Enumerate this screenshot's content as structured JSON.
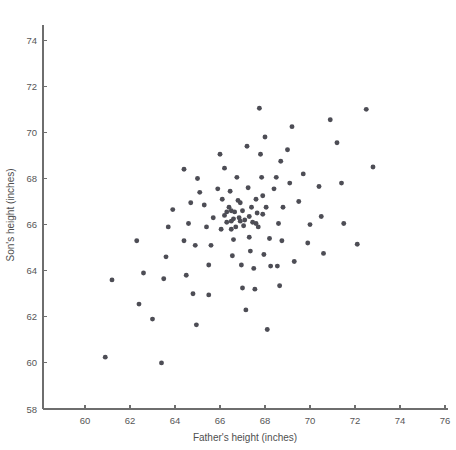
{
  "chart_data": {
    "type": "scatter",
    "title": "",
    "xlabel": "Father's height (inches)",
    "ylabel": "Son's height (inches)",
    "xlim": [
      58.8,
      76.5
    ],
    "ylim": [
      58,
      75.2
    ],
    "xticks": [
      60,
      62,
      64,
      66,
      68,
      70,
      72,
      74,
      76
    ],
    "yticks": [
      58,
      60,
      62,
      64,
      66,
      68,
      70,
      72,
      74
    ],
    "grid": false,
    "legend": null,
    "marker_color": "#4d4d55",
    "axis_color": "#6e6e6e",
    "background": "#ffffff",
    "n_points": 106,
    "points": [
      [
        60.9,
        60.25
      ],
      [
        61.2,
        63.6
      ],
      [
        62.4,
        62.55
      ],
      [
        62.3,
        65.3
      ],
      [
        62.6,
        63.9
      ],
      [
        63.0,
        61.9
      ],
      [
        63.4,
        60.0
      ],
      [
        63.5,
        63.65
      ],
      [
        63.6,
        64.6
      ],
      [
        63.7,
        65.9
      ],
      [
        63.9,
        66.65
      ],
      [
        64.4,
        68.4
      ],
      [
        64.4,
        65.3
      ],
      [
        64.5,
        63.8
      ],
      [
        64.6,
        66.05
      ],
      [
        64.7,
        66.95
      ],
      [
        64.8,
        63.0
      ],
      [
        64.9,
        65.1
      ],
      [
        64.95,
        61.65
      ],
      [
        65.0,
        68.0
      ],
      [
        65.1,
        67.4
      ],
      [
        65.3,
        66.85
      ],
      [
        65.4,
        65.9
      ],
      [
        65.5,
        62.95
      ],
      [
        65.5,
        64.25
      ],
      [
        65.6,
        65.1
      ],
      [
        65.7,
        66.3
      ],
      [
        65.9,
        67.55
      ],
      [
        66.0,
        69.05
      ],
      [
        66.05,
        65.8
      ],
      [
        66.2,
        68.45
      ],
      [
        66.3,
        66.55
      ],
      [
        66.3,
        66.1
      ],
      [
        66.4,
        66.75
      ],
      [
        66.45,
        67.45
      ],
      [
        66.5,
        66.6
      ],
      [
        66.5,
        66.15
      ],
      [
        66.5,
        65.8
      ],
      [
        66.55,
        64.65
      ],
      [
        66.6,
        66.25
      ],
      [
        66.6,
        65.35
      ],
      [
        66.65,
        66.55
      ],
      [
        66.7,
        65.9
      ],
      [
        66.75,
        68.05
      ],
      [
        66.8,
        67.05
      ],
      [
        66.85,
        66.3
      ],
      [
        66.9,
        66.15
      ],
      [
        66.95,
        64.25
      ],
      [
        67.0,
        63.25
      ],
      [
        67.0,
        66.6
      ],
      [
        67.05,
        65.95
      ],
      [
        67.1,
        66.2
      ],
      [
        67.15,
        62.3
      ],
      [
        67.2,
        69.4
      ],
      [
        67.25,
        67.6
      ],
      [
        67.3,
        65.45
      ],
      [
        67.35,
        64.85
      ],
      [
        67.4,
        66.75
      ],
      [
        67.45,
        66.1
      ],
      [
        67.5,
        64.1
      ],
      [
        67.55,
        63.2
      ],
      [
        67.6,
        67.1
      ],
      [
        67.65,
        66.5
      ],
      [
        67.7,
        65.9
      ],
      [
        67.75,
        71.05
      ],
      [
        67.8,
        69.05
      ],
      [
        67.85,
        68.05
      ],
      [
        67.9,
        67.25
      ],
      [
        67.9,
        66.45
      ],
      [
        67.95,
        64.7
      ],
      [
        68.0,
        69.8
      ],
      [
        68.05,
        66.75
      ],
      [
        68.1,
        61.45
      ],
      [
        68.2,
        65.4
      ],
      [
        68.25,
        64.2
      ],
      [
        68.4,
        67.55
      ],
      [
        68.5,
        68.05
      ],
      [
        68.55,
        64.2
      ],
      [
        68.6,
        66.05
      ],
      [
        68.65,
        63.35
      ],
      [
        68.7,
        68.75
      ],
      [
        68.75,
        65.3
      ],
      [
        68.8,
        66.75
      ],
      [
        69.0,
        69.25
      ],
      [
        69.1,
        67.8
      ],
      [
        69.2,
        70.25
      ],
      [
        69.3,
        64.4
      ],
      [
        69.5,
        67.0
      ],
      [
        69.7,
        68.2
      ],
      [
        69.9,
        65.2
      ],
      [
        70.0,
        66.0
      ],
      [
        70.4,
        67.65
      ],
      [
        70.5,
        66.35
      ],
      [
        70.6,
        64.75
      ],
      [
        70.9,
        70.55
      ],
      [
        71.2,
        69.55
      ],
      [
        71.4,
        67.8
      ],
      [
        71.5,
        66.05
      ],
      [
        72.1,
        65.15
      ],
      [
        72.5,
        71.0
      ],
      [
        72.8,
        68.5
      ],
      [
        66.2,
        66.4
      ],
      [
        67.3,
        66.35
      ],
      [
        66.9,
        66.95
      ],
      [
        67.6,
        66.05
      ],
      [
        66.1,
        67.1
      ]
    ]
  }
}
